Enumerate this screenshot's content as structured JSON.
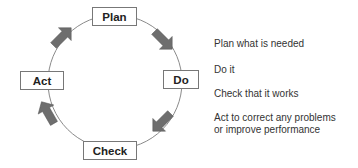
{
  "diagram": {
    "stages": [
      {
        "label": "Plan",
        "description": "Plan what is needed"
      },
      {
        "label": "Do",
        "description": "Do it"
      },
      {
        "label": "Check",
        "description": "Check that it works"
      },
      {
        "label": "Act",
        "description": "Act to correct any problems or improve performance"
      }
    ],
    "descriptions": {
      "plan": "Plan what is needed",
      "do": "Do it",
      "check": "Check that it works",
      "act_line1": "Act to correct any problems",
      "act_line2": "or improve performance"
    },
    "colors": {
      "arrow": "#6e6e6e",
      "circle": "#888888",
      "box_border": "#777777"
    }
  }
}
